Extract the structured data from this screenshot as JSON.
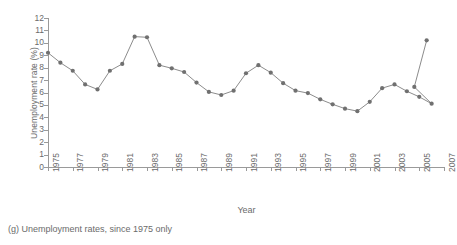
{
  "caption": "(g) Unemployment rates, since 1975 only",
  "colors": {
    "line": "#8c8c8c",
    "marker": "#707070",
    "axis": "#9a9a9a",
    "text": "#6b6b6b",
    "background": "#ffffff"
  },
  "chart_data": {
    "type": "line",
    "title": "",
    "xlabel": "Year",
    "ylabel": "Unemployment rate (%)",
    "xlim": [
      1975,
      2007
    ],
    "ylim": [
      0,
      12
    ],
    "grid": false,
    "legend": null,
    "xticks": [
      1975,
      1977,
      1979,
      1981,
      1983,
      1985,
      1987,
      1989,
      1991,
      1993,
      1995,
      1997,
      1999,
      2001,
      2003,
      2005,
      2007
    ],
    "xtick_labels": [
      "1975",
      "1977",
      "1979",
      "1981",
      "1983",
      "1985",
      "1987",
      "1989",
      "1991",
      "1993",
      "1995",
      "1997",
      "1999",
      "2001",
      "2003",
      "2005",
      "2007"
    ],
    "yticks": [
      0,
      1,
      2,
      3,
      4,
      5,
      6,
      7,
      8,
      9,
      10,
      11,
      12
    ],
    "ytick_labels": [
      "0",
      "1",
      "2",
      "3",
      "4",
      "5",
      "6",
      "7",
      "8",
      "9",
      "10",
      "11",
      "12"
    ],
    "x": [
      1975,
      1976,
      1977,
      1978,
      1979,
      1980,
      1981,
      1982,
      1983,
      1984,
      1985,
      1986,
      1987,
      1988,
      1989,
      1990,
      1991,
      1992,
      1993,
      1994,
      1995,
      1996,
      1997,
      1998,
      1999,
      2000,
      2001,
      2002,
      2003,
      2004,
      2005,
      2006
    ],
    "values": [
      9.2,
      8.4,
      7.75,
      6.65,
      6.25,
      7.75,
      8.3,
      10.5,
      10.45,
      8.2,
      7.95,
      7.65,
      6.8,
      6.05,
      5.8,
      6.15,
      7.55,
      8.2,
      7.6,
      6.75,
      6.15,
      5.95,
      5.45,
      5.05,
      4.7,
      4.5,
      5.25,
      6.35,
      6.65,
      6.1,
      5.65,
      5.1
    ],
    "series": [
      {
        "name": "Unemployment rate",
        "marker": "circle",
        "values": [
          9.2,
          8.4,
          7.75,
          6.65,
          6.25,
          7.75,
          8.3,
          10.5,
          10.45,
          8.2,
          7.95,
          7.65,
          6.8,
          6.05,
          5.8,
          6.15,
          7.55,
          8.2,
          7.6,
          6.75,
          6.15,
          5.95,
          5.45,
          5.05,
          4.7,
          4.5,
          5.25,
          6.35,
          6.65,
          6.1,
          5.65,
          5.1
        ]
      }
    ],
    "extra_points": {
      "x": [
        2004.6,
        2005.6
      ],
      "values": [
        6.45,
        10.2
      ]
    }
  }
}
